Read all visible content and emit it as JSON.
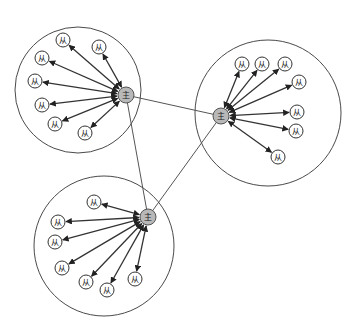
{
  "diagram": {
    "type": "master-slave-cluster-network",
    "master_label": "主",
    "slave_label": "从",
    "colors": {
      "master_fill": "#b8b8b8",
      "slave_fill": "#ffffff",
      "stroke": "#333333"
    },
    "clusters": [
      {
        "name": "top-left",
        "ring": {
          "cx": 78,
          "cy": 90,
          "r": 63
        },
        "master": {
          "x": 126,
          "y": 95
        },
        "slaves": [
          {
            "x": 63,
            "y": 40
          },
          {
            "x": 99,
            "y": 47
          },
          {
            "x": 42,
            "y": 58
          },
          {
            "x": 35,
            "y": 81
          },
          {
            "x": 42,
            "y": 105
          },
          {
            "x": 55,
            "y": 124
          },
          {
            "x": 85,
            "y": 133
          }
        ]
      },
      {
        "name": "right",
        "ring": {
          "cx": 268,
          "cy": 113,
          "r": 73
        },
        "master": {
          "x": 221,
          "y": 116
        },
        "slaves": [
          {
            "x": 242,
            "y": 64
          },
          {
            "x": 262,
            "y": 64
          },
          {
            "x": 285,
            "y": 64
          },
          {
            "x": 299,
            "y": 82
          },
          {
            "x": 297,
            "y": 112
          },
          {
            "x": 296,
            "y": 131
          },
          {
            "x": 278,
            "y": 157
          }
        ]
      },
      {
        "name": "bottom",
        "ring": {
          "cx": 104,
          "cy": 246,
          "r": 70
        },
        "master": {
          "x": 148,
          "y": 217
        },
        "slaves": [
          {
            "x": 94,
            "y": 202
          },
          {
            "x": 58,
            "y": 222
          },
          {
            "x": 55,
            "y": 242
          },
          {
            "x": 62,
            "y": 268
          },
          {
            "x": 86,
            "y": 282
          },
          {
            "x": 107,
            "y": 290
          },
          {
            "x": 135,
            "y": 279
          }
        ]
      }
    ],
    "master_links": [
      {
        "from": 0,
        "to": 1
      },
      {
        "from": 0,
        "to": 2
      },
      {
        "from": 1,
        "to": 2
      }
    ]
  }
}
